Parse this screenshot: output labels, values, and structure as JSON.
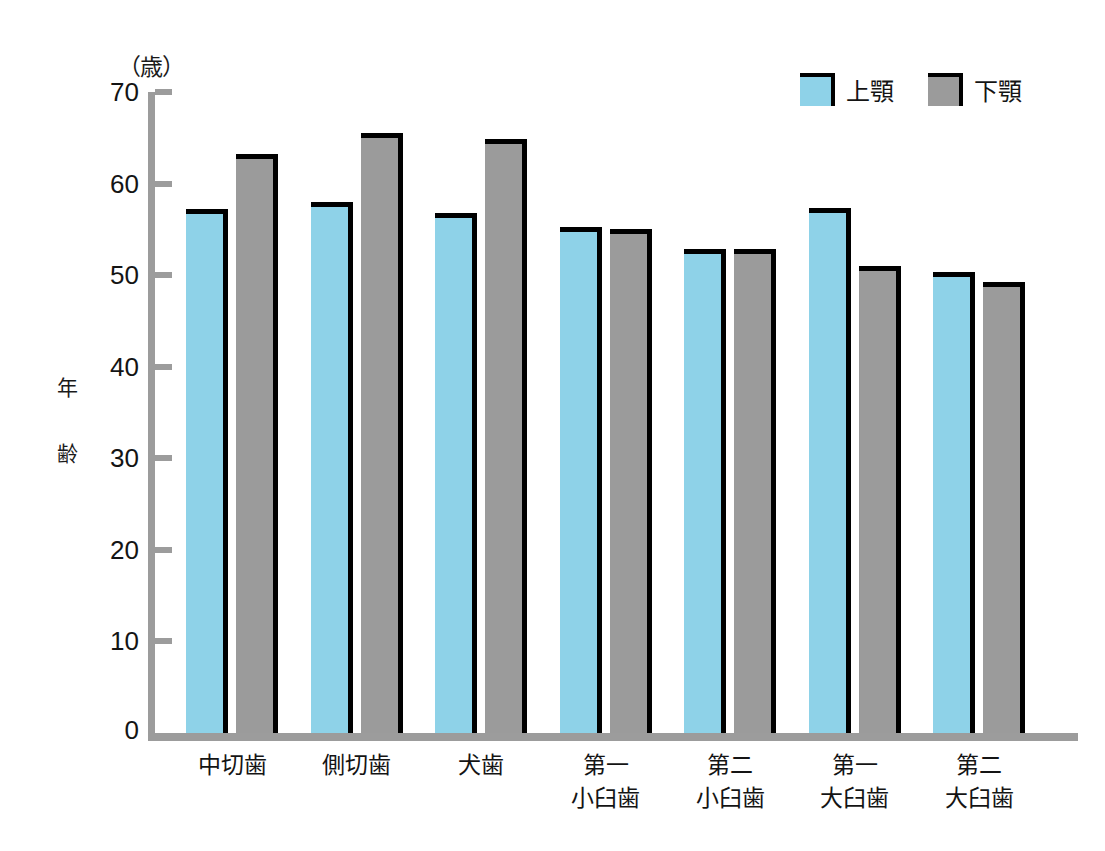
{
  "chart_data": {
    "type": "bar",
    "title": "",
    "subtitle": "",
    "unit_label": "（歳）",
    "ylabel": "年齢",
    "xlabel": "",
    "ylim": [
      0,
      70
    ],
    "ytick_values": [
      0,
      10,
      20,
      30,
      40,
      50,
      60,
      70
    ],
    "ytick_labels": [
      "0",
      "10",
      "20",
      "30",
      "40",
      "50",
      "60",
      "70"
    ],
    "grid": false,
    "legend_position": "top-right",
    "categories": [
      "中切歯",
      "側切歯",
      "犬歯",
      "第一小臼歯",
      "第二小臼歯",
      "第一大臼歯",
      "第二大臼歯"
    ],
    "category_lines": [
      [
        "中切歯"
      ],
      [
        "側切歯"
      ],
      [
        "犬歯"
      ],
      [
        "第一",
        "小臼歯"
      ],
      [
        "第二",
        "小臼歯"
      ],
      [
        "第一",
        "大臼歯"
      ],
      [
        "第二",
        "大臼歯"
      ]
    ],
    "series": [
      {
        "name": "上顎",
        "color": "#8ed2e8",
        "values": [
          57.2,
          58.0,
          56.8,
          55.3,
          52.9,
          57.3,
          50.3
        ]
      },
      {
        "name": "下顎",
        "color": "#9b9b9b",
        "values": [
          63.2,
          65.5,
          64.9,
          55.0,
          52.9,
          51.0,
          49.2
        ]
      }
    ]
  },
  "legend": {
    "items": [
      {
        "label": "上顎",
        "swatch": "upper"
      },
      {
        "label": "下顎",
        "swatch": "lower"
      }
    ]
  },
  "colors": {
    "upper_jaw": "#8ed2e8",
    "lower_jaw": "#9b9b9b",
    "axis": "#9c9c9c",
    "bar_outline": "#000000",
    "background": "#ffffff"
  }
}
